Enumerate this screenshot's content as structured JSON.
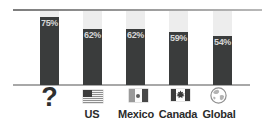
{
  "chart_data": {
    "type": "bar",
    "categories": [
      "",
      "US",
      "Mexico",
      "Canada",
      "Global"
    ],
    "values": [
      75,
      62,
      62,
      59,
      54
    ],
    "value_labels": [
      "75%",
      "62%",
      "62%",
      "59%",
      "54%"
    ],
    "icons": [
      "question-mark",
      "us-flag",
      "mexico-flag",
      "canada-flag",
      "globe"
    ],
    "title": "",
    "xlabel": "",
    "ylabel": "",
    "ylim": [
      0,
      100
    ],
    "grid": false,
    "legend": "none",
    "orientation": "vertical"
  },
  "icons": {
    "question_mark": "?"
  },
  "colors": {
    "bar_fill": "#3a3c3c",
    "bar_track": "#ededed",
    "axis_top": "#7d7d7d",
    "baseline": "#a8a8a8",
    "value_text": "#d6d6d6",
    "label_text": "#2b2b2b",
    "icon_dark": "#3c3c3c"
  }
}
